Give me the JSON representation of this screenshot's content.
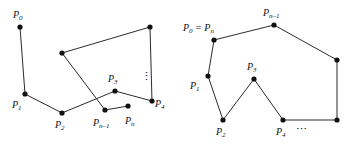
{
  "figure": {
    "caption": "",
    "colors": {
      "stroke": "#2b2b2b",
      "vertex": "#111111",
      "background": "#ffffff",
      "label": "#111111"
    },
    "panels": [
      {
        "id": "left",
        "name": "self-intersecting-polygon",
        "vertices": [
          {
            "name": "P0",
            "label_main": "P",
            "label_sub": "0",
            "x": 20,
            "y": 27,
            "lx": 13,
            "ly": 18
          },
          {
            "name": "P1",
            "label_main": "P",
            "label_sub": "1",
            "x": 25,
            "y": 94,
            "lx": 12,
            "ly": 108
          },
          {
            "name": "P2",
            "label_main": "P",
            "label_sub": "2",
            "x": 62,
            "y": 113,
            "lx": 55,
            "ly": 128
          },
          {
            "name": "P3",
            "label_main": "P",
            "label_sub": "3",
            "x": 115,
            "y": 91,
            "lx": 108,
            "ly": 82
          },
          {
            "name": "P4",
            "label_main": "P",
            "label_sub": "4",
            "x": 152,
            "y": 101,
            "lx": 155,
            "ly": 107
          },
          {
            "name": "Pn-1",
            "label_main": "P",
            "label_sub": "n–1",
            "x": 105,
            "y": 110,
            "lx": 93,
            "ly": 126
          },
          {
            "name": "Pn",
            "label_main": "P",
            "label_sub": "n",
            "x": 128,
            "y": 106,
            "lx": 125,
            "ly": 124
          },
          {
            "name": "V-top-mid",
            "label_main": "",
            "label_sub": "",
            "x": 62,
            "y": 53,
            "lx": 0,
            "ly": 0
          },
          {
            "name": "V-top-right",
            "label_main": "",
            "label_sub": "",
            "x": 150,
            "y": 27,
            "lx": 0,
            "ly": 0
          }
        ],
        "edges": [
          {
            "name": "edge-P0-P1",
            "from": "P0",
            "to": "P1"
          },
          {
            "name": "edge-P1-P2",
            "from": "P1",
            "to": "P2"
          },
          {
            "name": "edge-P2-P3",
            "from": "P2",
            "to": "P3"
          },
          {
            "name": "edge-P3-P4",
            "from": "P3",
            "to": "P4"
          },
          {
            "name": "edge-P4-topright",
            "from": "P4",
            "to": "V-top-right"
          },
          {
            "name": "edge-topright-topmid",
            "from": "V-top-right",
            "to": "V-top-mid"
          },
          {
            "name": "edge-topmid-Pn-1",
            "from": "V-top-mid",
            "to": "Pn-1"
          },
          {
            "name": "edge-Pn-1-Pn",
            "from": "Pn-1",
            "to": "Pn"
          }
        ],
        "ellipsis": [
          {
            "name": "vertical-ellipsis",
            "glyph": "⋮",
            "x": 141,
            "y": 80
          }
        ]
      },
      {
        "id": "right",
        "name": "simple-closed-polygon",
        "vertices": [
          {
            "name": "P0=Pn",
            "label_main": "P",
            "label_sub": "0",
            "label_eq": " = ",
            "label_main2": "P",
            "label_sub2": "n",
            "x": 214,
            "y": 40,
            "lx": 183,
            "ly": 31
          },
          {
            "name": "P1",
            "label_main": "P",
            "label_sub": "1",
            "x": 208,
            "y": 76,
            "lx": 190,
            "ly": 89
          },
          {
            "name": "P2",
            "label_main": "P",
            "label_sub": "2",
            "x": 223,
            "y": 120,
            "lx": 216,
            "ly": 135
          },
          {
            "name": "P3",
            "label_main": "P",
            "label_sub": "3",
            "x": 254,
            "y": 79,
            "lx": 247,
            "ly": 70
          },
          {
            "name": "P4",
            "label_main": "P",
            "label_sub": "4",
            "x": 283,
            "y": 120,
            "lx": 276,
            "ly": 135
          },
          {
            "name": "Pn-1",
            "label_main": "P",
            "label_sub": "n–1",
            "x": 274,
            "y": 25,
            "lx": 263,
            "ly": 16
          },
          {
            "name": "V-bottom-right",
            "label_main": "",
            "label_sub": "",
            "x": 337,
            "y": 120,
            "lx": 0,
            "ly": 0
          },
          {
            "name": "V-right",
            "label_main": "",
            "label_sub": "",
            "x": 337,
            "y": 60,
            "lx": 0,
            "ly": 0
          }
        ],
        "edges": [
          {
            "name": "edge-P0-P1",
            "from": "P0=Pn",
            "to": "P1"
          },
          {
            "name": "edge-P1-P2",
            "from": "P1",
            "to": "P2"
          },
          {
            "name": "edge-P2-P3",
            "from": "P2",
            "to": "P3"
          },
          {
            "name": "edge-P3-P4",
            "from": "P3",
            "to": "P4"
          },
          {
            "name": "edge-P4-bottomright",
            "from": "P4",
            "to": "V-bottom-right"
          },
          {
            "name": "edge-bottomright-right",
            "from": "V-bottom-right",
            "to": "V-right"
          },
          {
            "name": "edge-right-Pn-1",
            "from": "V-right",
            "to": "Pn-1"
          },
          {
            "name": "edge-Pn-1-P0",
            "from": "Pn-1",
            "to": "P0=Pn"
          }
        ],
        "ellipsis": [
          {
            "name": "horizontal-ellipsis",
            "glyph": "⋯",
            "x": 296,
            "y": 133
          }
        ]
      }
    ]
  }
}
